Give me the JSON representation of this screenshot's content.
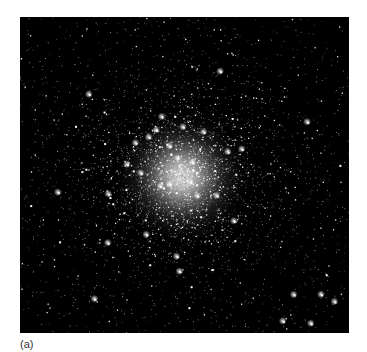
{
  "figure": {
    "caption_label": "(a)",
    "image": {
      "background_color": "#000000",
      "cluster_core": {
        "x": 162,
        "y": 160
      },
      "core_radius": 32,
      "star_count": 5200,
      "seed": 7
    }
  }
}
